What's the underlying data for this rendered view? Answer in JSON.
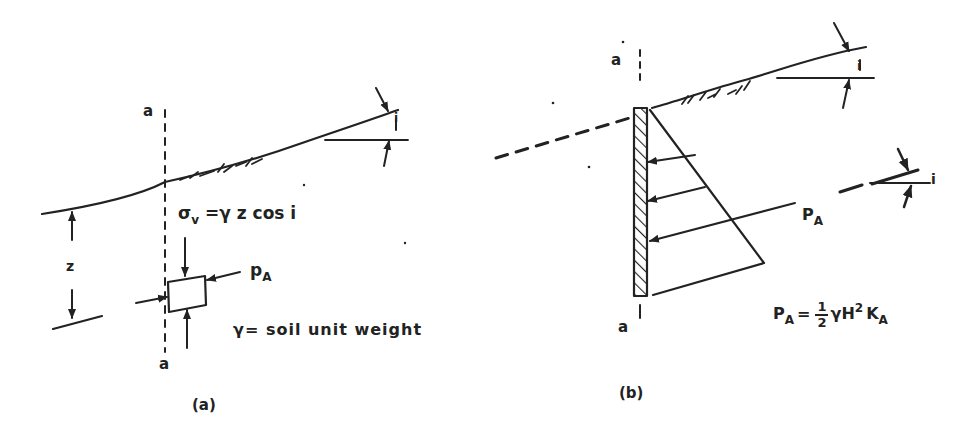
{
  "figure": {
    "panel_a": {
      "caption": "(a)",
      "section_label_top": "a",
      "section_label_bottom": "a",
      "depth_label": "z",
      "stress_eq": {
        "sigma": "σ",
        "sigma_sub": "v",
        "rhs": " =γ z cos i"
      },
      "pressure": {
        "symbol": "p",
        "sub": "A"
      },
      "legend": "γ= soil unit weight",
      "slope_angle": "i"
    },
    "panel_b": {
      "caption": "(b)",
      "section_label_top": "a",
      "section_label_bottom": "a",
      "resultant": {
        "symbol": "P",
        "sub": "A"
      },
      "slope_angle": "i",
      "force_angle": "i",
      "formula": {
        "lhs": "P",
        "lhs_sub": "A",
        "eq": "=",
        "num": "1",
        "den": "2",
        "rhs": "γH",
        "rhs_sup": "2",
        "rhs2": "K",
        "rhs2_sub": "A"
      }
    },
    "colors": {
      "ink": "#222222",
      "background": "#ffffff"
    }
  }
}
